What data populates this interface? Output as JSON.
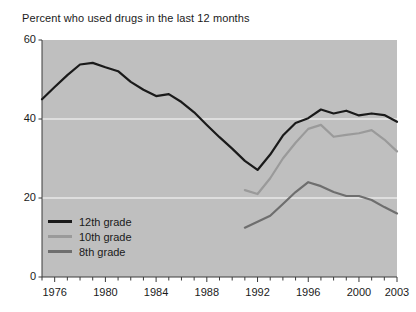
{
  "chart_data": {
    "type": "line",
    "title": "Percent who used drugs in the last 12 months",
    "xlabel": "",
    "ylabel": "",
    "xlim": [
      1975,
      2003
    ],
    "ylim": [
      0,
      60
    ],
    "yticks": [
      0,
      20,
      40,
      60
    ],
    "ytick_labels": [
      "0",
      "20",
      "40",
      "60"
    ],
    "xticks": [
      1976,
      1980,
      1984,
      1988,
      1992,
      1996,
      2000,
      2003
    ],
    "xtick_labels": [
      "1976",
      "1980",
      "1984",
      "1988",
      "1992",
      "1996",
      "2000",
      "2003"
    ],
    "minor_xticks_every": 1,
    "grid": "horizontal",
    "grid_color": "#e8e8e8",
    "plot_background": "#bfbfbf",
    "legend_position": "lower left",
    "series": [
      {
        "name": "12th grade",
        "color": "#1a1a1a",
        "x": [
          1975,
          1976,
          1977,
          1978,
          1979,
          1980,
          1981,
          1982,
          1983,
          1984,
          1985,
          1986,
          1987,
          1988,
          1989,
          1990,
          1991,
          1992,
          1993,
          1994,
          1995,
          1996,
          1997,
          1998,
          1999,
          2000,
          2001,
          2002,
          2003
        ],
        "y": [
          45.0,
          48.1,
          51.1,
          53.8,
          54.2,
          53.1,
          52.1,
          49.4,
          47.4,
          45.8,
          46.3,
          44.3,
          41.7,
          38.5,
          35.4,
          32.5,
          29.4,
          27.1,
          31.0,
          35.8,
          39.0,
          40.2,
          42.4,
          41.4,
          42.1,
          40.9,
          41.4,
          41.0,
          39.3
        ]
      },
      {
        "name": "10th grade",
        "color": "#9a9a9a",
        "x": [
          1991,
          1992,
          1993,
          1994,
          1995,
          1996,
          1997,
          1998,
          1999,
          2000,
          2001,
          2002,
          2003
        ],
        "y": [
          22.0,
          21.0,
          25.0,
          30.0,
          34.0,
          37.5,
          38.5,
          35.5,
          36.0,
          36.4,
          37.2,
          34.8,
          31.8
        ]
      },
      {
        "name": "8th grade",
        "color": "#6e6e6e",
        "x": [
          1991,
          1992,
          1993,
          1994,
          1995,
          1996,
          1997,
          1998,
          1999,
          2000,
          2001,
          2002,
          2003
        ],
        "y": [
          12.5,
          14.0,
          15.5,
          18.5,
          21.5,
          24.0,
          23.0,
          21.5,
          20.5,
          20.5,
          19.5,
          17.7,
          16.1
        ]
      }
    ]
  },
  "legend": {
    "items": [
      {
        "label": "12th grade",
        "color": "#1a1a1a"
      },
      {
        "label": "10th grade",
        "color": "#9a9a9a"
      },
      {
        "label": "8th grade",
        "color": "#6e6e6e"
      }
    ]
  }
}
